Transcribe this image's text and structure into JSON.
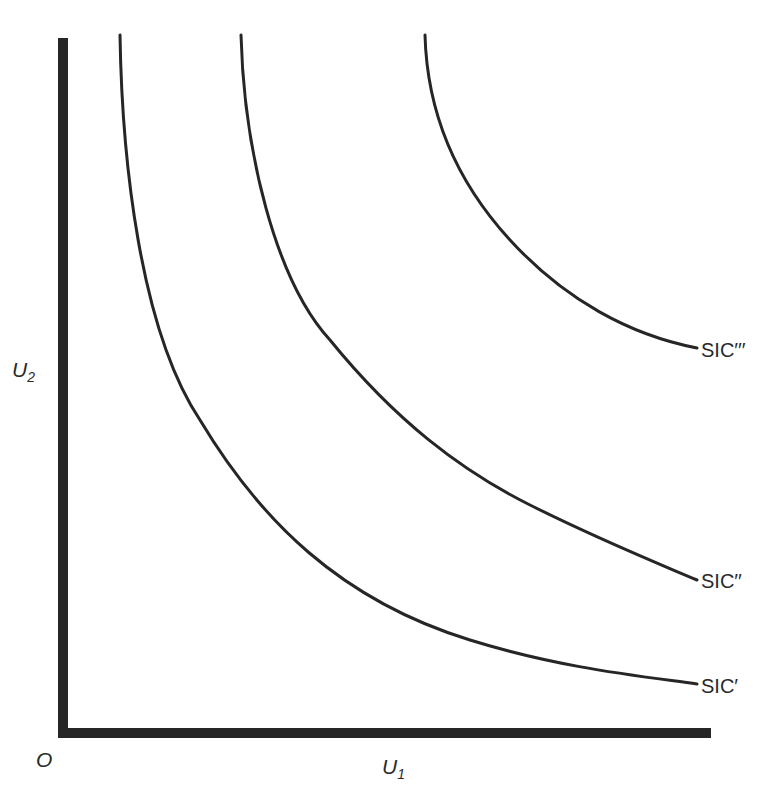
{
  "diagram": {
    "title": "",
    "origin_label": "O",
    "x_axis": {
      "label": "U",
      "subscript": "1",
      "start": [
        63,
        733
      ],
      "end": [
        711,
        733
      ],
      "thickness": 10
    },
    "y_axis": {
      "label": "U",
      "subscript": "2",
      "start": [
        63,
        38
      ],
      "end": [
        63,
        738
      ],
      "thickness": 10
    },
    "curves": [
      {
        "name": "SIC'",
        "label": "SIC′",
        "path": "M120,35 C122,160 140,330 200,420 C260,520 340,600 470,640 C560,668 640,676 697,684"
      },
      {
        "name": "SIC''",
        "label": "SIC′′",
        "path": "M241,35 C244,150 275,280 330,340 C395,420 460,470 530,505 C600,540 650,560 697,580"
      },
      {
        "name": "SIC'''",
        "label": "SIC′′′",
        "path": "M425,35 C427,110 455,180 510,240 C565,300 630,335 697,348"
      }
    ],
    "colors": {
      "line": "#262626",
      "axis": "#262626",
      "text": "#2a2a2a",
      "background": "#ffffff"
    }
  }
}
